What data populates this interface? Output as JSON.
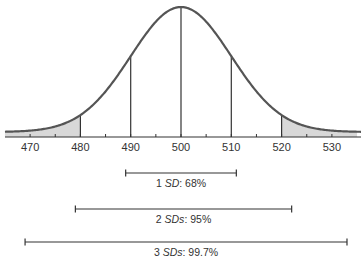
{
  "diagram": {
    "type": "normal-distribution",
    "mean": 500,
    "sd": 10,
    "x_axis": {
      "ticks": [
        470,
        480,
        490,
        500,
        510,
        520,
        530
      ],
      "tick_labels": [
        "470",
        "480",
        "490",
        "500",
        "510",
        "520",
        "530"
      ],
      "minor_ticks": [
        475,
        485,
        495,
        505,
        515,
        525
      ]
    },
    "vertical_lines_at": [
      490,
      500,
      510
    ],
    "shaded_tails": [
      {
        "from": 465,
        "to": 480
      },
      {
        "from": 520,
        "to": 535
      }
    ],
    "ranges": [
      {
        "num": "1",
        "unit": "SD",
        "suffix": ": 68%",
        "from": 489,
        "to": 511
      },
      {
        "num": "2",
        "unit": "SDs",
        "suffix": ": 95%",
        "from": 479,
        "to": 522
      },
      {
        "num": "3",
        "unit": "SDs",
        "suffix": ": 99.7%",
        "from": 469,
        "to": 533
      }
    ],
    "colors": {
      "curve": "#555555",
      "shade": "#d8d8d8",
      "line": "#333333",
      "text": "#333333"
    }
  }
}
